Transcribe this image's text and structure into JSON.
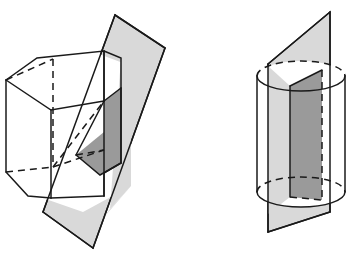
{
  "figure": {
    "background_color": "#ffffff",
    "width": 347,
    "height": 257,
    "stroke_color": "#1a1a1a",
    "plane_fill_color": "#d9d9d9",
    "section_fill_color": "#9a9a9a",
    "solid_fill_color": "#ffffff",
    "caption": ""
  },
  "panels": [
    {
      "id": "left-panel",
      "name": "hexagonal-prism-with-cutting-plane",
      "solid_type": "hexagonal prism",
      "label": "",
      "plane_orientation": "oblique",
      "cross_section_shape": "quadrilateral",
      "geometry": {
        "top_face": "6,80 37,58 83,48 131,66 130,99 49,117",
        "bottom_face": "6,172 37,196 83,212 131,186 130,155 49,173",
        "left_vertical_edge": "6,80 6,172",
        "front_left_vertical_edge": "49,117 49,173",
        "front_right_vertical_edge": "131,66 131,186",
        "hidden_vertical_edge": "83,48 83,212",
        "hidden_back_edge_right": "130,99 130,155",
        "hidden_diagonal": "37,196 130,155",
        "visible_front_top": "6,80 49,117 131,66",
        "visible_front_bottom": "6,172 49,173 131,186",
        "plane_outline": "115,15 165,48 93,248 43,212",
        "section_polygon": "104,101 120,90 120,162 104,173"
      }
    },
    {
      "id": "right-panel",
      "name": "cylinder-with-cutting-plane",
      "solid_type": "cylinder",
      "label": "",
      "plane_orientation": "vertical",
      "cross_section_shape": "rectangle",
      "geometry": {
        "top_ellipse_center": "301,76",
        "bottom_ellipse_center": "301,192",
        "ellipse_rx": 44,
        "ellipse_ry": 15,
        "left_side_edge": "257,76 257,192",
        "right_side_edge": "345,76 345,192",
        "plane_outline": "268,64 330,12 330,212 268,232",
        "section_polygon": "290,86 322,70 322,200 290,197"
      }
    }
  ],
  "icons": {
    "solid_edge": "solid-line",
    "hidden_edge": "dashed-line"
  }
}
